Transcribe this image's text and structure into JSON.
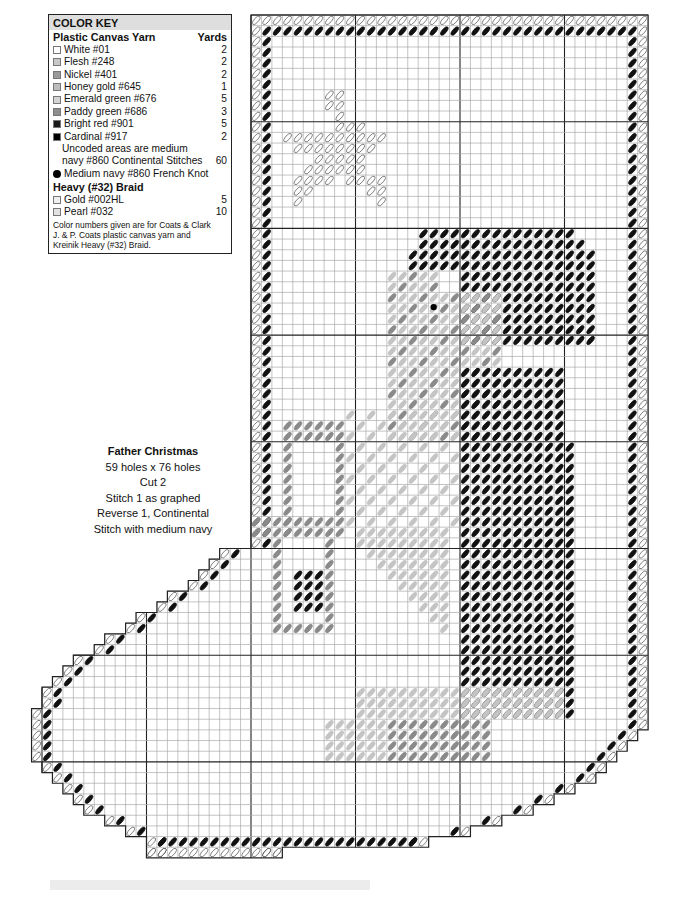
{
  "color_key": {
    "title": "COLOR KEY",
    "section1": {
      "label": "Plastic Canvas Yarn",
      "units_label": "Yards"
    },
    "yarns": [
      {
        "name": "White #01",
        "yards": "2",
        "swatch": "#ffffff"
      },
      {
        "name": "Flesh #248",
        "yards": "2",
        "swatch": "#c8c8c8"
      },
      {
        "name": "Nickel #401",
        "yards": "2",
        "swatch": "#9a9a9a"
      },
      {
        "name": "Honey gold #645",
        "yards": "1",
        "swatch": "#bdbdbd"
      },
      {
        "name": "Emerald green #676",
        "yards": "5",
        "swatch": "#d4d4d4"
      },
      {
        "name": "Paddy green #686",
        "yards": "3",
        "swatch": "#8e8e8e"
      },
      {
        "name": "Bright red #901",
        "yards": "5",
        "swatch": "#1a1a1a"
      },
      {
        "name": "Cardinal #917",
        "yards": "2",
        "swatch": "#000000"
      }
    ],
    "uncoded_line1": "Uncoded areas are medium",
    "uncoded_line2": "navy #860 Continental Stitches",
    "uncoded_yards": "60",
    "french_knot": "Medium navy #860 French Knot",
    "section2": {
      "label": "Heavy (#32) Braid"
    },
    "braids": [
      {
        "name": "Gold #002HL",
        "yards": "5",
        "swatch": "#efefef"
      },
      {
        "name": "Pearl #032",
        "yards": "10",
        "swatch": "#e2e2e2"
      }
    ],
    "note_lines": [
      "Color numbers given are for Coats & Clark",
      "J. & P. Coats plastic canvas yarn and",
      "Kreinik Heavy (#32) Braid."
    ]
  },
  "caption": {
    "title": "Father Christmas",
    "lines": [
      "59 holes x 76 holes",
      "Cut 2",
      "Stitch 1 as graphed",
      "Reverse 1, Continental",
      "Stitch with medium navy"
    ]
  },
  "chart_data": {
    "type": "stitch-grid",
    "title": "Father Christmas",
    "grid": {
      "origin_x": 251,
      "origin_y": 15,
      "cell_w": 10.45,
      "cell_h": 10.67,
      "cols": 38,
      "rows": 79,
      "major_every": 10
    },
    "colors": {
      "white": "#ffffff",
      "black": "#111111",
      "gray": "#8a8a8a",
      "light": "#c4c4c4",
      "outline_stitch": "#555555",
      "grid_minor": "#9c9c9c",
      "grid_major": "#222222"
    },
    "stitch_legend": {
      "W": "white outline",
      "B": "bright red / cardinal (black)",
      "G": "paddy green / nickel (dark gray)",
      "L": "flesh / emerald (light gray)",
      "S": "honey gold long stitch"
    }
  }
}
